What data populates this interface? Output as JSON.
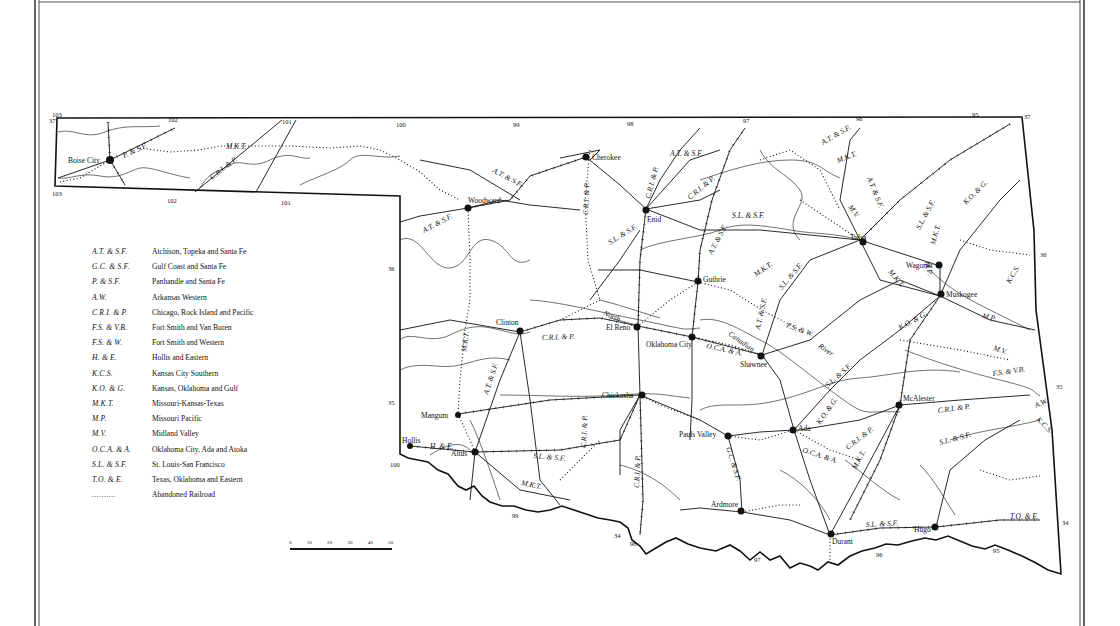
{
  "map": {
    "title": "Oklahoma Railroads",
    "coordinates": {
      "top_longitudes": [
        "103",
        "102",
        "101",
        "100",
        "99",
        "98",
        "97",
        "96",
        "95"
      ],
      "panhandle_bottom_longitudes": [
        "103",
        "102",
        "101"
      ],
      "latitudes_right": [
        "37",
        "36",
        "35",
        "34"
      ],
      "latitude_left_panhandle": "37",
      "latitude_left_36": "36",
      "latitude_left_35": "35",
      "southern_labels": [
        "100",
        "99",
        "34",
        "98",
        "97",
        "96",
        "95"
      ]
    },
    "cities": [
      {
        "name": "Boise City"
      },
      {
        "name": "Cherokee"
      },
      {
        "name": "Woodward"
      },
      {
        "name": "Enid"
      },
      {
        "name": "Tulsa"
      },
      {
        "name": "Wagoner"
      },
      {
        "name": "Muskogee"
      },
      {
        "name": "Guthrie"
      },
      {
        "name": "Clinton"
      },
      {
        "name": "El Reno"
      },
      {
        "name": "Oklahoma City"
      },
      {
        "name": "Shawnee"
      },
      {
        "name": "Mangum"
      },
      {
        "name": "Chickasha"
      },
      {
        "name": "Hollis"
      },
      {
        "name": "Altus"
      },
      {
        "name": "Pauls Valley"
      },
      {
        "name": "Ada"
      },
      {
        "name": "McAlester"
      },
      {
        "name": "Ardmore"
      },
      {
        "name": "Durant"
      },
      {
        "name": "Hugo"
      }
    ],
    "railroad_labels": {
      "ps_f": "P. & S.F.",
      "mkt": "M.K.T.",
      "cri_p": "C.R.I. & P.",
      "atsf": "A.T. & S.F.",
      "slsf": "S.L. & S.F.",
      "mv": "M.V.",
      "mp": "M.P.",
      "kog": "K.O. & G.",
      "kcs": "K.C.S.",
      "fsw": "F.S. & W.",
      "fsvb": "F.S. & V.B.",
      "aw": "A.W.",
      "oca": "O.C.A. & A.",
      "he": "H. & E.",
      "gcsf": "G.C. & S.F.",
      "toe": "T.O. & E."
    },
    "river_labels": {
      "north": "North",
      "canadian": "Canadian",
      "river": "River"
    }
  },
  "legend": {
    "items": [
      {
        "abbr": "A.T. & S.F.",
        "name": "Atchison, Topeka and Santa Fe"
      },
      {
        "abbr": "G.C. & S.F.",
        "name": "Gulf Coast and Santa Fe"
      },
      {
        "abbr": "P. & S.F.",
        "name": "Panhandle and Santa Fe"
      },
      {
        "abbr": "A.W.",
        "name": "Arkansas Western"
      },
      {
        "abbr": "C.R.I. & P.",
        "name": "Chicago, Rock Island and Pacific"
      },
      {
        "abbr": "F.S. & V.B.",
        "name": "Fort Smith and Van Buren"
      },
      {
        "abbr": "F.S. & W.",
        "name": "Fort Smith and Western"
      },
      {
        "abbr": "H. & E.",
        "name": "Hollis and Eastern"
      },
      {
        "abbr": "K.C.S.",
        "name": "Kansas City Southern"
      },
      {
        "abbr": "K.O. & G.",
        "name": "Kansas, Oklahoma and Gulf"
      },
      {
        "abbr": "M.K.T.",
        "name": "Missouri-Kansas-Texas"
      },
      {
        "abbr": "M.P.",
        "name": "Missouri Pacific"
      },
      {
        "abbr": "M.V.",
        "name": "Midland Valley"
      },
      {
        "abbr": "O.C.A. & A.",
        "name": "Oklahoma City, Ada and Atoka"
      },
      {
        "abbr": "S.L. & S.F.",
        "name": "St. Louis-San Francisco"
      },
      {
        "abbr": "T.O. & E.",
        "name": "Texas, Oklahoma and Eastern"
      },
      {
        "abbr": "..........",
        "name": "Abandoned Railroad"
      }
    ]
  },
  "scale": {
    "ticks": [
      "0",
      "10",
      "20",
      "30",
      "40",
      "50"
    ]
  }
}
